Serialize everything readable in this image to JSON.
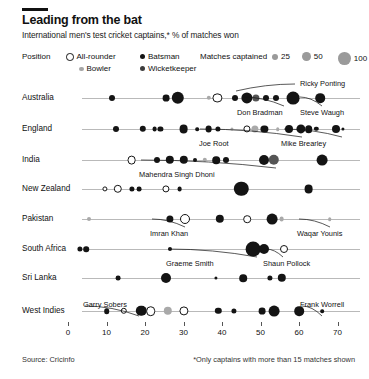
{
  "header": {
    "title": "Leading from the bat",
    "subtitle": "International men's test cricket captains,* % of matches won"
  },
  "legend": {
    "position_title": "Position",
    "position_items": [
      {
        "label": "All-rounder",
        "style": "hollow",
        "color": "#ffffff"
      },
      {
        "label": "Batsman",
        "style": "filled",
        "color": "#141414"
      },
      {
        "label": "Bowler",
        "style": "filled",
        "color": "#a6a6a6"
      },
      {
        "label": "Wicketkeeper",
        "style": "filled",
        "color": "#3d3d3d"
      }
    ],
    "size_title": "Matches captained",
    "size_items": [
      {
        "label": "25",
        "radius": 3.0
      },
      {
        "label": "50",
        "radius": 4.4
      },
      {
        "label": "100",
        "radius": 6.4
      }
    ]
  },
  "footer": {
    "source": "Source: Cricinfo",
    "note": "*Only captains with more than 15 matches shown"
  },
  "chart_data": {
    "type": "scatter",
    "title": "Leading from the bat",
    "subtitle": "International men's test cricket captains,* % of matches won",
    "xlabel": "",
    "ylabel": "",
    "xlim": [
      -2,
      74
    ],
    "xticks": [
      0,
      10,
      20,
      30,
      40,
      50,
      60,
      70
    ],
    "grid": false,
    "legend_position": "top",
    "size_encodes": "matches captained",
    "color_encodes": "position",
    "categories": [
      "Australia",
      "England",
      "India",
      "New Zealand",
      "Pakistan",
      "South Africa",
      "Sri Lanka",
      "West Indies"
    ],
    "series": [
      {
        "name": "Australia",
        "points": [
          {
            "x": 11.5,
            "r": 3.0,
            "pos": "Batsman"
          },
          {
            "x": 25.5,
            "r": 3.4,
            "pos": "Batsman"
          },
          {
            "x": 28.5,
            "r": 6.2,
            "pos": "Batsman"
          },
          {
            "x": 36.5,
            "r": 2.2,
            "pos": "Bowler"
          },
          {
            "x": 38.8,
            "r": 4.6,
            "pos": "All-rounder"
          },
          {
            "x": 43.5,
            "r": 3.0,
            "pos": "Batsman"
          },
          {
            "x": 46.5,
            "r": 5.6,
            "pos": "Batsman"
          },
          {
            "x": 48.8,
            "r": 3.6,
            "pos": "Wicketkeeper"
          },
          {
            "x": 51.5,
            "r": 3.0,
            "pos": "Batsman"
          },
          {
            "x": 54.0,
            "r": 3.0,
            "pos": "Batsman"
          },
          {
            "x": 58.5,
            "r": 6.4,
            "pos": "Batsman",
            "label": "Ricky Ponting"
          },
          {
            "x": 65.5,
            "r": 4.8,
            "pos": "Batsman",
            "label": "Steve Waugh"
          },
          {
            "x": 46.5,
            "r": 0,
            "pos": "Batsman",
            "label": "Don Bradman"
          }
        ]
      },
      {
        "name": "England",
        "points": [
          {
            "x": 12.5,
            "r": 3.0,
            "pos": "Batsman"
          },
          {
            "x": 19.5,
            "r": 3.2,
            "pos": "Batsman"
          },
          {
            "x": 22.5,
            "r": 2.4,
            "pos": "Batsman"
          },
          {
            "x": 24.0,
            "r": 2.6,
            "pos": "Batsman"
          },
          {
            "x": 30.0,
            "r": 4.4,
            "pos": "Batsman"
          },
          {
            "x": 33.5,
            "r": 1.8,
            "pos": "Batsman"
          },
          {
            "x": 36.5,
            "r": 3.4,
            "pos": "Batsman"
          },
          {
            "x": 39.0,
            "r": 2.6,
            "pos": "Batsman"
          },
          {
            "x": 42.5,
            "r": 1.6,
            "pos": "Bowler"
          },
          {
            "x": 46.5,
            "r": 3.6,
            "pos": "All-rounder"
          },
          {
            "x": 48.5,
            "r": 3.6,
            "pos": "Bowler"
          },
          {
            "x": 51.0,
            "r": 3.6,
            "pos": "Batsman"
          },
          {
            "x": 54.5,
            "r": 1.8,
            "pos": "Bowler"
          },
          {
            "x": 57.5,
            "r": 4.0,
            "pos": "Batsman"
          },
          {
            "x": 60.5,
            "r": 4.6,
            "pos": "Batsman",
            "label": "Joe Root"
          },
          {
            "x": 62.5,
            "r": 3.8,
            "pos": "Batsman"
          },
          {
            "x": 64.5,
            "r": 2.2,
            "pos": "Batsman"
          },
          {
            "x": 69.5,
            "r": 4.0,
            "pos": "Batsman",
            "label": "Mike Brearley"
          },
          {
            "x": 71.5,
            "r": 1.6,
            "pos": "Batsman"
          }
        ]
      },
      {
        "name": "India",
        "points": [
          {
            "x": 16.5,
            "r": 4.4,
            "pos": "All-rounder"
          },
          {
            "x": 23.0,
            "r": 3.0,
            "pos": "Batsman"
          },
          {
            "x": 26.5,
            "r": 4.2,
            "pos": "Batsman"
          },
          {
            "x": 30.0,
            "r": 4.2,
            "pos": "Batsman"
          },
          {
            "x": 33.0,
            "r": 2.0,
            "pos": "Batsman"
          },
          {
            "x": 35.5,
            "r": 2.2,
            "pos": "Bowler"
          },
          {
            "x": 38.5,
            "r": 3.8,
            "pos": "Batsman"
          },
          {
            "x": 41.0,
            "r": 3.0,
            "pos": "Batsman"
          },
          {
            "x": 51.0,
            "r": 5.0,
            "pos": "Batsman"
          },
          {
            "x": 53.5,
            "r": 5.2,
            "pos": "Wicketkeeper",
            "label": "Mahendra Singh Dhoni"
          },
          {
            "x": 66.0,
            "r": 5.4,
            "pos": "Batsman"
          }
        ]
      },
      {
        "name": "New Zealand",
        "points": [
          {
            "x": 9.5,
            "r": 2.6,
            "pos": "All-rounder"
          },
          {
            "x": 13.0,
            "r": 4.2,
            "pos": "All-rounder"
          },
          {
            "x": 16.5,
            "r": 2.6,
            "pos": "Batsman"
          },
          {
            "x": 18.5,
            "r": 2.4,
            "pos": "Batsman"
          },
          {
            "x": 25.5,
            "r": 3.6,
            "pos": "All-rounder"
          },
          {
            "x": 29.0,
            "r": 2.4,
            "pos": "Batsman"
          },
          {
            "x": 45.0,
            "r": 7.2,
            "pos": "Batsman"
          },
          {
            "x": 62.5,
            "r": 4.4,
            "pos": "Batsman"
          }
        ]
      },
      {
        "name": "Pakistan",
        "points": [
          {
            "x": 5.5,
            "r": 2.0,
            "pos": "Bowler"
          },
          {
            "x": 26.5,
            "r": 3.6,
            "pos": "Batsman"
          },
          {
            "x": 30.5,
            "r": 5.0,
            "pos": "All-rounder",
            "label": "Imran Khan"
          },
          {
            "x": 39.5,
            "r": 4.2,
            "pos": "Batsman"
          },
          {
            "x": 46.5,
            "r": 3.8,
            "pos": "All-rounder"
          },
          {
            "x": 53.0,
            "r": 5.4,
            "pos": "Batsman"
          },
          {
            "x": 55.5,
            "r": 2.4,
            "pos": "Bowler"
          },
          {
            "x": 68.0,
            "r": 1.8,
            "pos": "Bowler",
            "label": "Waqar Younis"
          }
        ]
      },
      {
        "name": "South Africa",
        "points": [
          {
            "x": 3.0,
            "r": 2.6,
            "pos": "Batsman"
          },
          {
            "x": 4.8,
            "r": 2.8,
            "pos": "Batsman"
          },
          {
            "x": 26.5,
            "r": 2.0,
            "pos": "Batsman"
          },
          {
            "x": 48.0,
            "r": 7.4,
            "pos": "Batsman",
            "label": "Graeme Smith"
          },
          {
            "x": 51.0,
            "r": 5.0,
            "pos": "Batsman"
          },
          {
            "x": 56.0,
            "r": 4.0,
            "pos": "All-rounder",
            "label": "Shaun Pollock"
          }
        ]
      },
      {
        "name": "Sri Lanka",
        "points": [
          {
            "x": 13.0,
            "r": 2.4,
            "pos": "Batsman"
          },
          {
            "x": 25.5,
            "r": 5.0,
            "pos": "Batsman"
          },
          {
            "x": 38.5,
            "r": 1.6,
            "pos": "Batsman"
          },
          {
            "x": 45.5,
            "r": 3.8,
            "pos": "Batsman"
          },
          {
            "x": 52.5,
            "r": 2.6,
            "pos": "Batsman"
          },
          {
            "x": 55.5,
            "r": 4.2,
            "pos": "Batsman"
          }
        ]
      },
      {
        "name": "West Indies",
        "points": [
          {
            "x": 10.0,
            "r": 2.8,
            "pos": "Batsman"
          },
          {
            "x": 14.5,
            "r": 3.2,
            "pos": "All-rounder"
          },
          {
            "x": 19.0,
            "r": 5.2,
            "pos": "Batsman",
            "label": "Garry Sobers"
          },
          {
            "x": 21.5,
            "r": 4.8,
            "pos": "All-rounder"
          },
          {
            "x": 26.0,
            "r": 4.2,
            "pos": "Bowler"
          },
          {
            "x": 30.0,
            "r": 4.6,
            "pos": "All-rounder"
          },
          {
            "x": 39.0,
            "r": 3.2,
            "pos": "Batsman"
          },
          {
            "x": 43.0,
            "r": 2.6,
            "pos": "Batsman"
          },
          {
            "x": 50.5,
            "r": 3.4,
            "pos": "Batsman"
          },
          {
            "x": 53.5,
            "r": 5.4,
            "pos": "Batsman"
          },
          {
            "x": 60.0,
            "r": 4.8,
            "pos": "Batsman"
          },
          {
            "x": 66.0,
            "r": 1.8,
            "pos": "Batsman",
            "label": "Frank Worrell"
          }
        ]
      }
    ],
    "annotations": [
      {
        "text": "Ricky Ponting",
        "row": "Australia"
      },
      {
        "text": "Steve Waugh",
        "row": "Australia"
      },
      {
        "text": "Don Bradman",
        "row": "Australia"
      },
      {
        "text": "Joe Root",
        "row": "England"
      },
      {
        "text": "Mike Brearley",
        "row": "England"
      },
      {
        "text": "Mahendra Singh Dhoni",
        "row": "India"
      },
      {
        "text": "Imran Khan",
        "row": "Pakistan"
      },
      {
        "text": "Waqar Younis",
        "row": "Pakistan"
      },
      {
        "text": "Graeme Smith",
        "row": "South Africa"
      },
      {
        "text": "Shaun Pollock",
        "row": "South Africa"
      },
      {
        "text": "Garry Sobers",
        "row": "West Indies"
      },
      {
        "text": "Frank Worrell",
        "row": "West Indies"
      }
    ]
  }
}
